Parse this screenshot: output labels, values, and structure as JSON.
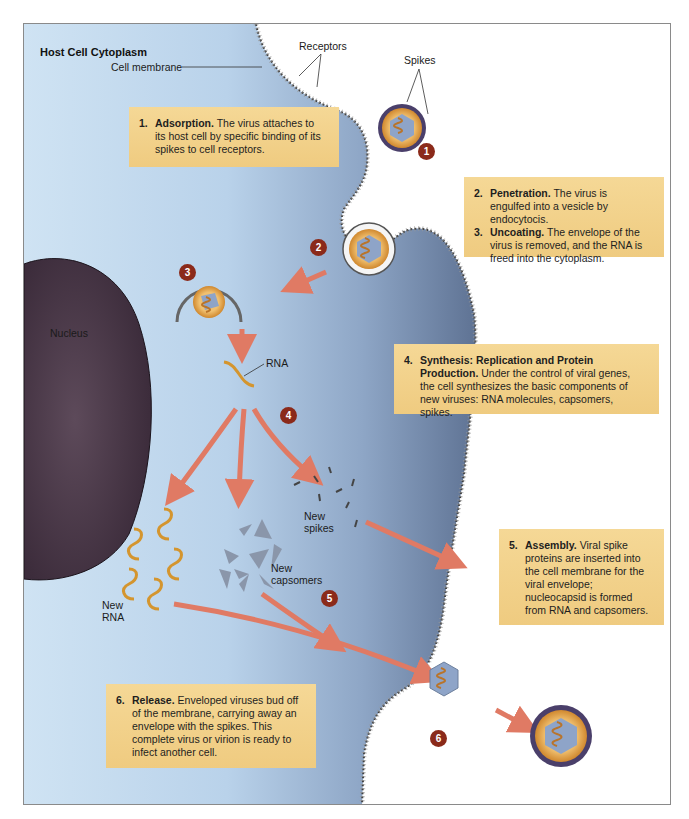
{
  "figure": {
    "region_label": "Host Cell Cytoplasm",
    "labels": {
      "cell_membrane": "Cell membrane",
      "receptors": "Receptors",
      "spikes": "Spikes",
      "nucleus": "Nucleus",
      "rna": "RNA",
      "new_spikes_1": "New",
      "new_spikes_2": "spikes",
      "new_capsomers_1": "New",
      "new_capsomers_2": "capsomers",
      "new_rna_1": "New",
      "new_rna_2": "RNA"
    },
    "badges": [
      "1",
      "2",
      "3",
      "4",
      "5",
      "6"
    ],
    "steps": [
      {
        "num": "1.",
        "title": "Adsorption.",
        "text": " The virus attaches to its host cell by specific binding of its spikes to cell receptors."
      },
      {
        "num": "2.",
        "title": "Penetration.",
        "text": " The virus is engulfed into a vesicle by endocytocis."
      },
      {
        "num": "3.",
        "title": "Uncoating.",
        "text": " The envelope of the virus is removed, and the RNA is freed into the cytoplasm."
      },
      {
        "num": "4.",
        "title": "Synthesis: Replication and Protein Production.",
        "text": " Under the control of viral genes, the cell synthesizes the basic components of new viruses: RNA molecules, capsomers, spikes."
      },
      {
        "num": "5.",
        "title": "Assembly.",
        "text": " Viral spike proteins are inserted into the cell membrane for the viral envelope; nucleocapsid is formed from RNA and capsomers."
      },
      {
        "num": "6.",
        "title": "Release.",
        "text": " Enveloped viruses bud off of the membrane, carrying away an envelope with the spikes. This complete virus or virion is ready to infect another cell."
      }
    ],
    "colors": {
      "cytoplasm_light": "#c9dff0",
      "cytoplasm_dark": "#5b6f8e",
      "nucleus": "#4a3848",
      "text_box": "#f2d28c",
      "badge": "#8b2a1a",
      "arrow": "#e07a64",
      "rna": "#d4952e",
      "capsid": "#8a9bb6"
    }
  }
}
